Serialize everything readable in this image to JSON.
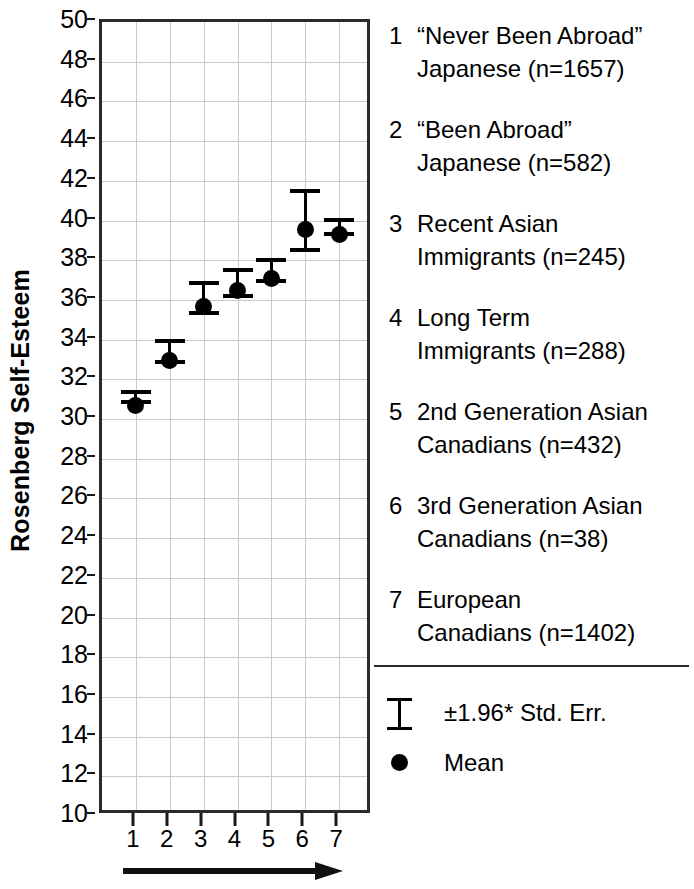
{
  "chart_data": {
    "type": "scatter",
    "title": "",
    "xlabel": "",
    "ylabel": "Rosenberg Self-Esteem",
    "ylim": [
      10,
      50
    ],
    "ytick_step": 2,
    "yticks": [
      10,
      12,
      14,
      16,
      18,
      20,
      22,
      24,
      26,
      28,
      30,
      32,
      34,
      36,
      38,
      40,
      42,
      44,
      46,
      48,
      50
    ],
    "xticks": [
      1,
      2,
      3,
      4,
      5,
      6,
      7
    ],
    "xtick_labels": [
      "1",
      "2",
      "3",
      "4",
      "5",
      "6",
      "7"
    ],
    "grid": true,
    "legend_position": "right",
    "x": [
      1,
      2,
      3,
      4,
      5,
      6,
      7
    ],
    "values": [
      31.1,
      33.4,
      36.1,
      36.9,
      37.5,
      40.0,
      39.7
    ],
    "error_low": [
      30.75,
      32.75,
      35.25,
      36.1,
      36.85,
      38.4,
      39.2
    ],
    "error_high": [
      31.45,
      34.05,
      36.95,
      37.6,
      38.1,
      41.6,
      40.15
    ],
    "series": [
      {
        "name": "Mean",
        "values": [
          31.1,
          33.4,
          36.1,
          36.9,
          37.5,
          40.0,
          39.7
        ]
      }
    ],
    "error_type": "±1.96* Std. Err.",
    "annotations": [
      "arrow pointing right beneath x-axis"
    ]
  },
  "axis": {
    "y_title": "Rosenberg Self-Esteem",
    "y_tick_labels": [
      "50",
      "48",
      "46",
      "44",
      "42",
      "40",
      "38",
      "36",
      "34",
      "32",
      "30",
      "28",
      "26",
      "24",
      "22",
      "20",
      "18",
      "16",
      "14",
      "12",
      "10"
    ],
    "x_tick_labels": [
      "1",
      "2",
      "3",
      "4",
      "5",
      "6",
      "7"
    ]
  },
  "legend": {
    "groups": [
      {
        "num": "1",
        "label": "“Never Been Abroad”\nJapanese (n=1657)"
      },
      {
        "num": "2",
        "label": "“Been Abroad”\nJapanese (n=582)"
      },
      {
        "num": "3",
        "label": "Recent Asian\nImmigrants (n=245)"
      },
      {
        "num": "4",
        "label": "Long Term\nImmigrants (n=288)"
      },
      {
        "num": "5",
        "label": "2nd Generation Asian\nCanadians (n=432)"
      },
      {
        "num": "6",
        "label": "3rd Generation Asian\nCanadians (n=38)"
      },
      {
        "num": "7",
        "label": "European\nCanadians (n=1402)"
      }
    ],
    "symbols": [
      {
        "icon": "error-bar-icon",
        "label": "±1.96* Std. Err."
      },
      {
        "icon": "mean-dot-icon",
        "label": "Mean"
      }
    ]
  },
  "colors": {
    "marker": "#000000",
    "axis": "#2b2b2b",
    "grid": "#c9c9c9",
    "background": "#ffffff"
  }
}
